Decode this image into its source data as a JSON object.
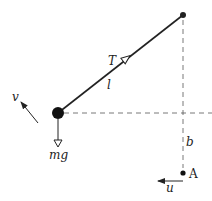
{
  "diagram": {
    "type": "pendulum-physics-diagram",
    "labels": {
      "tension": "T",
      "length": "l",
      "velocity": "v",
      "weight": "mg",
      "height": "b",
      "point": "A",
      "point_velocity": "u"
    },
    "colors": {
      "line": "#222222",
      "dashed": "#555555",
      "background": "#ffffff"
    }
  }
}
